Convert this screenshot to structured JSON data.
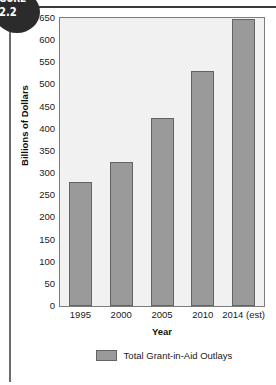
{
  "figure": {
    "word": "GURE",
    "number": "2.2"
  },
  "chart_data": {
    "type": "bar",
    "title": "",
    "categories": [
      "1995",
      "2000",
      "2005",
      "2010",
      "2014 (est)"
    ],
    "values": [
      280,
      325,
      425,
      530,
      648
    ],
    "series": [
      {
        "name": "Total Grant-in-Aid Outlays",
        "values": [
          280,
          325,
          425,
          530,
          648
        ]
      }
    ],
    "xlabel": "Year",
    "ylabel": "Billions of Dollars",
    "ylim": [
      0,
      650
    ],
    "ytick_step": 50,
    "yticks": [
      0,
      50,
      100,
      150,
      200,
      250,
      300,
      350,
      400,
      450,
      500,
      550,
      600,
      650
    ],
    "ytick_labels": [
      "0",
      "50",
      "100",
      "150",
      "200",
      "250",
      "300",
      "350",
      "400",
      "450",
      "500",
      "550",
      "600",
      "650"
    ],
    "grid": false,
    "legend": {
      "position": "bottom",
      "entries": [
        "Total Grant-in-Aid Outlays"
      ]
    },
    "colors": {
      "bar_fill": "#9a9a9a",
      "bar_stroke": "#636363",
      "plot_background": "#f1f1f1",
      "plot_border": "#7c7c7c",
      "text": "#1a1a1a",
      "rule": "#3a3a3a",
      "badge": "#2b2b2b"
    }
  }
}
